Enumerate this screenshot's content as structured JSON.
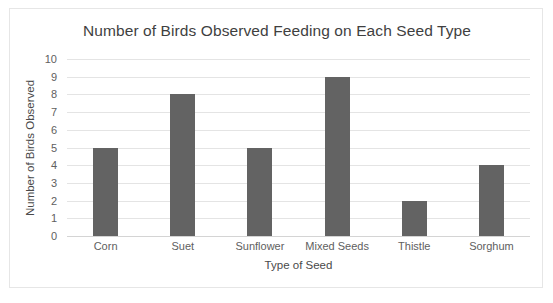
{
  "chart_data": {
    "type": "bar",
    "title": "Number of Birds Observed Feeding on Each Seed Type",
    "xlabel": "Type of Seed",
    "ylabel": "Number of Birds Observed",
    "categories": [
      "Corn",
      "Suet",
      "Sunflower",
      "Mixed Seeds",
      "Thistle",
      "Sorghum"
    ],
    "values": [
      5,
      8,
      5,
      9,
      2,
      4
    ],
    "ylim": [
      0,
      10
    ],
    "ytick_labels": [
      "10",
      "9",
      "8",
      "7",
      "6",
      "5",
      "4",
      "3",
      "2",
      "1",
      "0"
    ],
    "ytick_values": [
      10,
      9,
      8,
      7,
      6,
      5,
      4,
      3,
      2,
      1,
      0
    ],
    "grid": true,
    "legend": false,
    "bar_color": "#636363",
    "grid_color": "#e4e4e4",
    "text_color": "#606060",
    "title_color": "#3f3f3f",
    "background": "#ffffff",
    "border_color": "#e6e6e6"
  }
}
